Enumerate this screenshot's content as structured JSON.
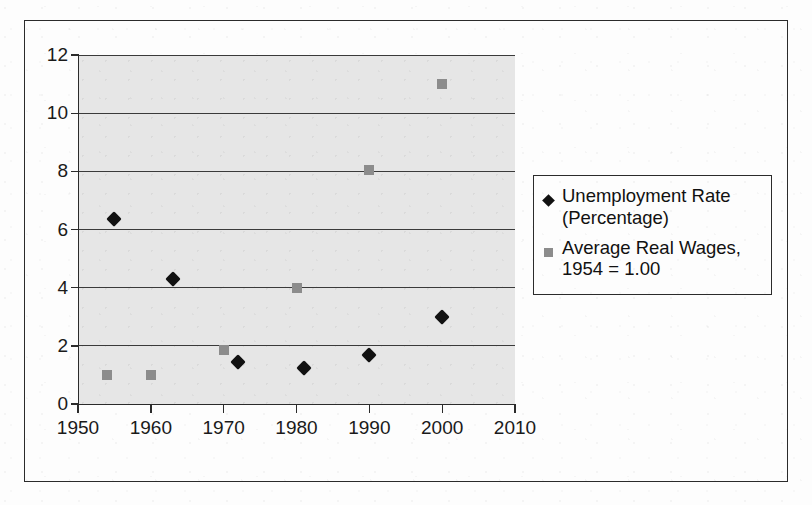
{
  "chart_data": {
    "type": "scatter",
    "title": "",
    "xlabel": "",
    "ylabel": "",
    "xlim": [
      1950,
      2010
    ],
    "ylim": [
      0,
      12
    ],
    "grid": true,
    "legend_position": "right",
    "x_ticks": [
      "1950",
      "1960",
      "1970",
      "1980",
      "1990",
      "2000",
      "2010"
    ],
    "y_ticks": [
      "0",
      "2",
      "4",
      "6",
      "8",
      "10",
      "12"
    ],
    "series": [
      {
        "name": "Unemployment Rate (Percentage)",
        "marker": "diamond",
        "color": "#111111",
        "points": [
          {
            "x": 1955,
            "y": 6.35
          },
          {
            "x": 1963,
            "y": 4.3
          },
          {
            "x": 1972,
            "y": 1.45
          },
          {
            "x": 1981,
            "y": 1.25
          },
          {
            "x": 1990,
            "y": 1.7
          },
          {
            "x": 2000,
            "y": 3.0
          }
        ]
      },
      {
        "name": "Average Real Wages, 1954 = 1.00",
        "marker": "square",
        "color": "#8c8c8c",
        "points": [
          {
            "x": 1954,
            "y": 1.0
          },
          {
            "x": 1960,
            "y": 1.0
          },
          {
            "x": 1970,
            "y": 1.85
          },
          {
            "x": 1980,
            "y": 4.0
          },
          {
            "x": 1990,
            "y": 8.05
          },
          {
            "x": 2000,
            "y": 11.0
          }
        ]
      }
    ]
  },
  "legend": {
    "entries": [
      {
        "label": "Unemployment Rate\n(Percentage)",
        "marker": "diamond"
      },
      {
        "label": "Average Real Wages,\n1954 = 1.00",
        "marker": "square"
      }
    ]
  },
  "axes": {
    "y_labels": [
      "12",
      "10",
      "8",
      "6",
      "4",
      "2",
      "0"
    ],
    "x_labels": [
      "1950",
      "1960",
      "1970",
      "1980",
      "1990",
      "2000",
      "2010"
    ]
  },
  "colors": {
    "plot_background": "#e6e6e6",
    "series1": "#111111",
    "series2": "#8c8c8c",
    "axis": "#2b2b2b",
    "page": "#fdfdfd"
  }
}
